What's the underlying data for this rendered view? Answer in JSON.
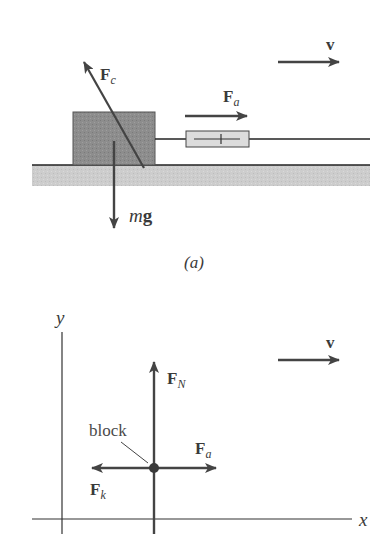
{
  "figure_a": {
    "caption": "(a)",
    "labels": {
      "velocity": "v",
      "force_c": {
        "main": "F",
        "sub": "c"
      },
      "force_a": {
        "main": "F",
        "sub": "a"
      },
      "weight": {
        "italic": "m",
        "bold": "g"
      }
    },
    "colors": {
      "block_fill": "#8d8d8d",
      "ground_fill": "#cfcfcf",
      "scale_fill": "#dcdcdc",
      "arrow": "#444444",
      "line": "#222222"
    }
  },
  "figure_b": {
    "axes": {
      "x_label": "x",
      "y_label": "y"
    },
    "block_label": "block",
    "labels": {
      "velocity": "v",
      "force_n": {
        "main": "F",
        "sub": "N"
      },
      "force_a": {
        "main": "F",
        "sub": "a"
      },
      "force_k": {
        "main": "F",
        "sub": "k"
      }
    },
    "colors": {
      "arrow": "#444444",
      "axis": "#333333",
      "dot": "#3a3a3a"
    }
  }
}
